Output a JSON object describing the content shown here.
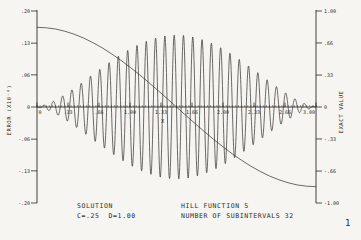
{
  "colors": {
    "background": "#f6f5f1",
    "ink": "#2e2c29"
  },
  "page_number": "1",
  "footer": {
    "solution_line1": "SOLUTION",
    "solution_line2": "C=.25  D=1.00",
    "function_line1": "HILL FUNCTION 5",
    "function_line2": "NUMBER OF SUBINTERVALS 32"
  },
  "chart_data": {
    "type": "line",
    "title": "",
    "xlabel": "X",
    "ylabel_left": "ERROR (X10⁻⁸)",
    "ylabel_right": "EXACT VALUE",
    "x_range": [
      0,
      3
    ],
    "y_left_range": [
      -0.2,
      0.2
    ],
    "y_right_range": [
      -1.0,
      1.0
    ],
    "grid": false,
    "legend": "none",
    "x_ticks": {
      "values": [
        0,
        0.333,
        0.667,
        1.0,
        1.333,
        1.667,
        2.0,
        2.333,
        2.667,
        3.0
      ],
      "labels": [
        "0",
        ".33",
        ".66",
        "1.00",
        "1.33",
        "1.66",
        "2.00",
        "2.33",
        "2.66",
        "3.00"
      ]
    },
    "x_minor_tick_intervals": 90,
    "y_left_ticks": {
      "values": [
        0.2,
        0.133,
        0.067,
        0,
        -0.067,
        -0.133,
        -0.2
      ],
      "labels": [
        ".20",
        ".13",
        ".06",
        "0",
        "-.06",
        "-.13",
        "-.20"
      ]
    },
    "y_right_ticks": {
      "values": [
        1.0,
        0.667,
        0.333,
        0,
        -0.333,
        -0.667,
        -1.0
      ],
      "labels": [
        "1.00",
        ".66",
        ".33",
        "0",
        "-.33",
        "-.66",
        "-1.00"
      ]
    },
    "series": [
      {
        "name": "exact-value",
        "axis": "right",
        "style": "smooth-sigmoid",
        "x": [
          0,
          0.1,
          0.2,
          0.3,
          0.4,
          0.5,
          0.6,
          0.7,
          0.8,
          0.9,
          1.0,
          1.1,
          1.2,
          1.3,
          1.4,
          1.5,
          1.6,
          1.7,
          1.8,
          1.9,
          2.0,
          2.1,
          2.2,
          2.3,
          2.4,
          2.5,
          2.6,
          2.7,
          2.8,
          2.9,
          3.0
        ],
        "y": [
          0.83,
          0.825,
          0.812,
          0.789,
          0.758,
          0.719,
          0.671,
          0.617,
          0.555,
          0.488,
          0.415,
          0.338,
          0.256,
          0.173,
          0.087,
          0.0,
          -0.087,
          -0.173,
          -0.256,
          -0.338,
          -0.415,
          -0.488,
          -0.555,
          -0.617,
          -0.671,
          -0.719,
          -0.758,
          -0.789,
          -0.812,
          -0.825,
          -0.83
        ]
      },
      {
        "name": "error",
        "axis": "left",
        "style": "amplitude-modulated-oscillation",
        "cycles_per_unit": 10,
        "start_direction": "down",
        "envelope_x": [
          0,
          0.1,
          0.2,
          0.3,
          0.4,
          0.5,
          0.6,
          0.7,
          0.8,
          0.9,
          1.0,
          1.1,
          1.2,
          1.3,
          1.4,
          1.5,
          1.6,
          1.7,
          1.8,
          1.9,
          2.0,
          2.1,
          2.2,
          2.3,
          2.4,
          2.5,
          2.6,
          2.7,
          2.8,
          2.9,
          3.0
        ],
        "envelope_amplitude": [
          0.0,
          0.005,
          0.014,
          0.026,
          0.039,
          0.053,
          0.068,
          0.082,
          0.096,
          0.109,
          0.121,
          0.131,
          0.139,
          0.145,
          0.149,
          0.15,
          0.149,
          0.145,
          0.139,
          0.131,
          0.121,
          0.109,
          0.096,
          0.082,
          0.068,
          0.053,
          0.039,
          0.026,
          0.014,
          0.005,
          0.0
        ]
      }
    ]
  }
}
